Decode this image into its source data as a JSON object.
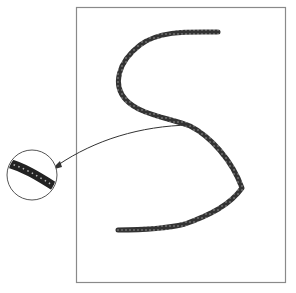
{
  "diagram": {
    "frame": {
      "x": 76,
      "y": 7,
      "width": 209,
      "height": 275,
      "stroke": "#8a8a8a"
    },
    "stroke": {
      "color": "#3a3a3a",
      "width": 5,
      "path": "M218,32 C190,32 160,30 140,45 C118,62 112,85 126,100 C140,115 170,118 190,126 C210,136 232,160 242,188 C230,205 210,215 185,224 C160,230 135,230 118,230"
    },
    "arrow": {
      "color": "#333333",
      "path": "M190,125 C140,126 95,140 58,165",
      "head": {
        "x": 52,
        "y": 170
      }
    },
    "magnifier": {
      "cx": 32,
      "cy": 175,
      "r": 25,
      "border": "#555555",
      "inner_stroke": {
        "color": "#222222",
        "width": 8,
        "path": "M6,163 C22,167 38,176 56,188"
      }
    }
  }
}
